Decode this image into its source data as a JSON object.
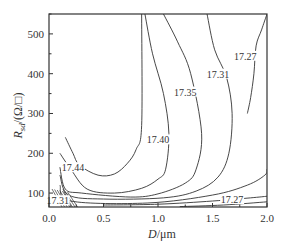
{
  "chart_data": {
    "type": "contour",
    "title": "",
    "xlabel": "D/μm",
    "xlabel_italic_part": "D",
    "xlabel_rest": "/μm",
    "ylabel": "R_sd/(Ω/□)",
    "ylabel_italic_part": "R",
    "ylabel_sub": "sd",
    "ylabel_rest": "/(Ω/□)",
    "xlim": [
      0.0,
      2.0
    ],
    "ylim": [
      65,
      550
    ],
    "xticks": [
      "0.0",
      "0.5",
      "1.0",
      "1.5",
      "2.0"
    ],
    "xtick_values": [
      0.0,
      0.5,
      1.0,
      1.5,
      2.0
    ],
    "yticks": [
      "100",
      "200",
      "300",
      "400",
      "500"
    ],
    "ytick_values": [
      100,
      200,
      300,
      400,
      500
    ],
    "grid": false,
    "contour_levels": [
      {
        "level": 17.44,
        "label": "17.44",
        "label_pos": [
          0.22,
          165
        ]
      },
      {
        "level": 17.4,
        "label": "17.40",
        "label_pos": [
          1.0,
          235
        ]
      },
      {
        "level": 17.35,
        "label": "17.35",
        "label_pos": [
          1.25,
          355
        ]
      },
      {
        "level": 17.31,
        "label": "17.31",
        "label_pos": [
          1.55,
          400
        ]
      },
      {
        "level": 17.27,
        "label": "17.27",
        "label_pos": [
          1.8,
          445
        ]
      },
      {
        "level": 17.27,
        "label": "17.27",
        "label_pos": [
          1.68,
          85
        ]
      },
      {
        "level": 17.31,
        "label": "17.31",
        "label_pos": [
          0.08,
          82
        ]
      }
    ],
    "contour_lines": [
      {
        "name": "17.44",
        "points": [
          [
            0.15,
            240
          ],
          [
            0.22,
            200
          ],
          [
            0.28,
            170
          ],
          [
            0.45,
            145
          ],
          [
            0.6,
            148
          ],
          [
            0.72,
            175
          ],
          [
            0.8,
            210
          ],
          [
            0.85,
            270
          ],
          [
            0.85,
            550
          ]
        ]
      },
      {
        "name": "17.40",
        "points": [
          [
            0.1,
            200
          ],
          [
            0.2,
            160
          ],
          [
            0.35,
            110
          ],
          [
            0.6,
            100
          ],
          [
            0.85,
            112
          ],
          [
            1.0,
            135
          ],
          [
            1.07,
            160
          ],
          [
            1.1,
            250
          ],
          [
            1.05,
            350
          ],
          [
            0.95,
            450
          ],
          [
            0.88,
            550
          ]
        ]
      },
      {
        "name": "17.35",
        "points": [
          [
            0.1,
            165
          ],
          [
            0.15,
            110
          ],
          [
            0.3,
            100
          ],
          [
            0.75,
            90
          ],
          [
            1.0,
            98
          ],
          [
            1.25,
            125
          ],
          [
            1.35,
            160
          ],
          [
            1.4,
            250
          ],
          [
            1.3,
            400
          ],
          [
            1.18,
            480
          ],
          [
            1.05,
            550
          ]
        ]
      },
      {
        "name": "17.31",
        "points": [
          [
            0.1,
            145
          ],
          [
            0.18,
            95
          ],
          [
            0.5,
            85
          ],
          [
            1.05,
            88
          ],
          [
            1.35,
            105
          ],
          [
            1.55,
            140
          ],
          [
            1.65,
            200
          ],
          [
            1.68,
            300
          ],
          [
            1.63,
            390
          ],
          [
            1.52,
            460
          ],
          [
            1.45,
            550
          ]
        ]
      },
      {
        "name": "17.27",
        "points": [
          [
            0.1,
            120
          ],
          [
            0.2,
            80
          ],
          [
            0.9,
            75
          ],
          [
            1.5,
            95
          ],
          [
            1.82,
            120
          ],
          [
            1.98,
            145
          ],
          [
            2.0,
            160
          ]
        ]
      },
      {
        "name": "17.27b",
        "points": [
          [
            2.0,
            550
          ],
          [
            1.95,
            510
          ],
          [
            1.9,
            470
          ],
          [
            1.88,
            400
          ],
          [
            1.85,
            340
          ],
          [
            1.82,
            300
          ]
        ]
      },
      {
        "name": "low-1",
        "points": [
          [
            0.5,
            70
          ],
          [
            1.0,
            72
          ],
          [
            1.5,
            80
          ],
          [
            1.85,
            88
          ],
          [
            2.0,
            92
          ]
        ]
      },
      {
        "name": "low-2",
        "points": [
          [
            1.2,
            66
          ],
          [
            1.6,
            70
          ],
          [
            2.0,
            78
          ]
        ]
      }
    ]
  }
}
